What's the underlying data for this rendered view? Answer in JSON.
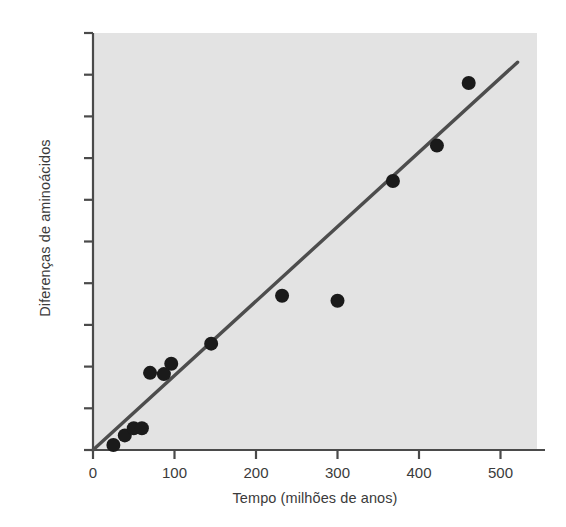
{
  "chart_data": {
    "type": "scatter",
    "title": "",
    "xlabel": "Tempo (milhões de anos)",
    "ylabel": "Diferenças de aminoácidos",
    "xlim": [
      0,
      545
    ],
    "ylim": [
      0.0,
      1.0
    ],
    "grid": false,
    "legend": null,
    "xticks": [
      0,
      100,
      200,
      300,
      400,
      500
    ],
    "xtick_labels": [
      "0",
      "100",
      "200",
      "300",
      "400",
      "500"
    ],
    "yticks": [
      0.0,
      0.1,
      0.2,
      0.3,
      0.4,
      0.5,
      0.6,
      0.7,
      0.8,
      0.9,
      1.0
    ],
    "ytick_labels": [
      "0,0",
      "0,1",
      "0,2",
      "0,3",
      "0,4",
      "0,5",
      "0,6",
      "0,7",
      "0,8",
      "0,9",
      "1,0"
    ],
    "series": [
      {
        "name": "Pontos de dados",
        "marker": "circle",
        "color": "#1a1a1a",
        "x": [
          25,
          39,
          50,
          60,
          70,
          87,
          96,
          145,
          232,
          300,
          368,
          422,
          461
        ],
        "y": [
          0.012,
          0.035,
          0.052,
          0.052,
          0.185,
          0.182,
          0.207,
          0.255,
          0.37,
          0.358,
          0.645,
          0.73,
          0.88
        ]
      },
      {
        "name": "Linha de regressão",
        "type": "line",
        "color": "#4d4d4d",
        "x": [
          0,
          521
        ],
        "y": [
          0.0,
          0.93
        ]
      }
    ],
    "plot_background": "#e3e3e3",
    "axis_color": "#4a4a4a",
    "text_color": "#3b3b3b"
  },
  "axes": {
    "y_title": "Diferenças de aminoácidos",
    "x_title": "Tempo (milhões de anos)",
    "ytick_labels": [
      "0,0",
      "0,1",
      "0,2",
      "0,3",
      "0,4",
      "0,5",
      "0,6",
      "0,7",
      "0,8",
      "0,9",
      "1,0"
    ],
    "xtick_labels": [
      "0",
      "100",
      "200",
      "300",
      "400",
      "500"
    ]
  }
}
